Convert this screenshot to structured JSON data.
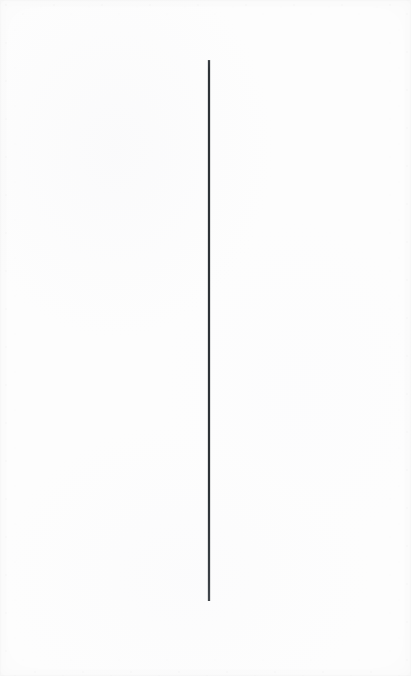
{
  "document": {
    "kind": "scanned-page",
    "page_background_color": "#fdfdfd",
    "page_width": 411,
    "page_height": 676,
    "visible_text": "",
    "notes_label": ""
  },
  "marks": {
    "count": 1,
    "items": [
      {
        "name": "vertical-rule",
        "shape": "line",
        "orientation": "vertical",
        "color": "#2e3338",
        "x": 209,
        "y_start": 60,
        "y_end": 601,
        "length": 541,
        "thickness": 2
      }
    ]
  },
  "paper": {
    "edge_shadow_color": "#f2f2f2",
    "grain": "fine-speckle",
    "vignette": "subtle"
  }
}
